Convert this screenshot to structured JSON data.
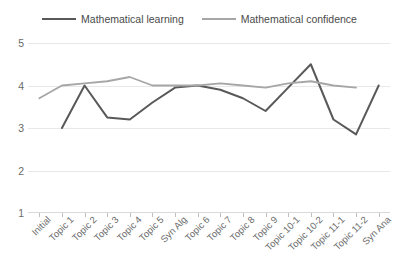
{
  "chart_data": {
    "type": "line",
    "title": "",
    "xlabel": "",
    "ylabel": "",
    "ylim": [
      1,
      5
    ],
    "yticks": [
      1,
      2,
      3,
      4,
      5
    ],
    "grid": true,
    "legend_position": "top-center",
    "categories": [
      "Initial",
      "Topic 1",
      "Topic 2",
      "Topic 3",
      "Topic 4",
      "Topic 5",
      "Syn Alg",
      "Topic 6",
      "Topic 7",
      "Topic 8",
      "Topic 9",
      "Topic 10-1",
      "Topic 10-2",
      "Topic 11-1",
      "Topic 11-2",
      "Syn Ana"
    ],
    "series": [
      {
        "name": "Mathematical learning",
        "color": "#595959",
        "values": [
          null,
          3.0,
          4.0,
          3.25,
          3.2,
          3.6,
          3.95,
          4.0,
          3.9,
          3.7,
          3.4,
          3.95,
          4.5,
          3.2,
          2.85,
          4.0
        ]
      },
      {
        "name": "Mathematical confidence",
        "color": "#a6a6a6",
        "values": [
          3.7,
          4.0,
          4.05,
          4.1,
          4.2,
          4.0,
          4.0,
          4.0,
          4.05,
          4.0,
          3.95,
          4.05,
          4.1,
          4.0,
          3.95,
          null
        ]
      }
    ]
  },
  "legend": {
    "entries": [
      {
        "label": "Mathematical learning"
      },
      {
        "label": "Mathematical confidence"
      }
    ]
  }
}
